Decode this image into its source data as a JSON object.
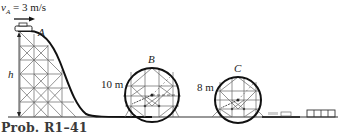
{
  "figure": {
    "caption": "Prob. R1–41",
    "velocity_label": {
      "symbol": "v",
      "subscript": "A",
      "value": "= 3 m/s"
    },
    "points": {
      "A": "A",
      "B": "B",
      "C": "C",
      "h": "h"
    },
    "loops": [
      {
        "name": "B",
        "radius_label": "10 m"
      },
      {
        "name": "C",
        "radius_label": "8 m"
      }
    ],
    "colors": {
      "track": "#1a1a1a",
      "truss": "#555555",
      "text": "#222222"
    }
  }
}
